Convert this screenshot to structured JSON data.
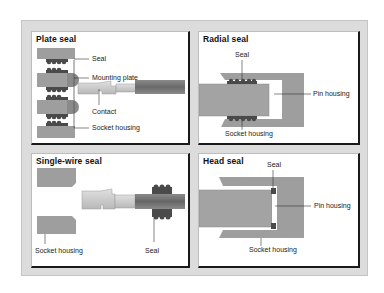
{
  "colors": {
    "housing": "#9e9e9e",
    "seal": "#4a4a4a",
    "contact_light": "#c8c8c8",
    "wire": "#707070",
    "leader": "#333333"
  },
  "panels": [
    {
      "title": "Plate seal",
      "labels": [
        "Seal",
        "Mounting plate",
        "Contact",
        "Socket housing"
      ]
    },
    {
      "title": "Radial seal",
      "labels": [
        "Seal",
        "Pin housing",
        "Socket housing"
      ]
    },
    {
      "title": "Single-wire seal",
      "labels": [
        "Socket housing",
        "Seal"
      ]
    },
    {
      "title": "Head seal",
      "labels": [
        "Seal",
        "Pin housing",
        "Socket housing"
      ]
    }
  ]
}
